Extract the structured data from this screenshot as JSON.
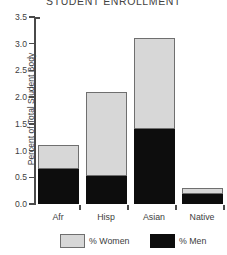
{
  "chart_data": {
    "type": "bar",
    "subtype": "stacked-bar",
    "title": "STUDENT ENROLLMENT",
    "xlabel": "",
    "ylabel": "Percent of Total Student Body",
    "categories": [
      "Afr",
      "Hisp",
      "Asian",
      "Native"
    ],
    "series": [
      {
        "name": "% Men",
        "color": "#0d0d0d",
        "values": [
          0.65,
          0.52,
          1.4,
          0.18
        ]
      },
      {
        "name": "% Women",
        "color": "#d7d7d7",
        "values": [
          0.45,
          1.58,
          1.7,
          0.12
        ]
      }
    ],
    "totals": [
      1.1,
      2.1,
      3.1,
      0.3
    ],
    "ylim": [
      0.0,
      3.5
    ],
    "ytick_values": [
      3.5,
      3.0,
      2.5,
      2.0,
      1.5,
      1.0,
      0.5,
      0.0
    ],
    "ytick_labels": [
      "3.5",
      "3.0",
      "2.5",
      "2.0",
      "1.5",
      "1.0",
      "0.5",
      "0.0"
    ],
    "grid": false,
    "legend_position": "bottom",
    "legend_entries": [
      "% Women",
      "% Men"
    ],
    "stack_order_bottom_to_top": [
      "% Men",
      "% Women"
    ]
  },
  "axis": {
    "y_title": "Percent of Total Student Body"
  },
  "legend": {
    "women_label": "% Women",
    "men_label": "% Men"
  },
  "colors": {
    "women": "#d7d7d7",
    "men": "#0d0d0d",
    "axis": "#4a4a4a",
    "text": "#3d3d3d",
    "background": "#ffffff"
  }
}
